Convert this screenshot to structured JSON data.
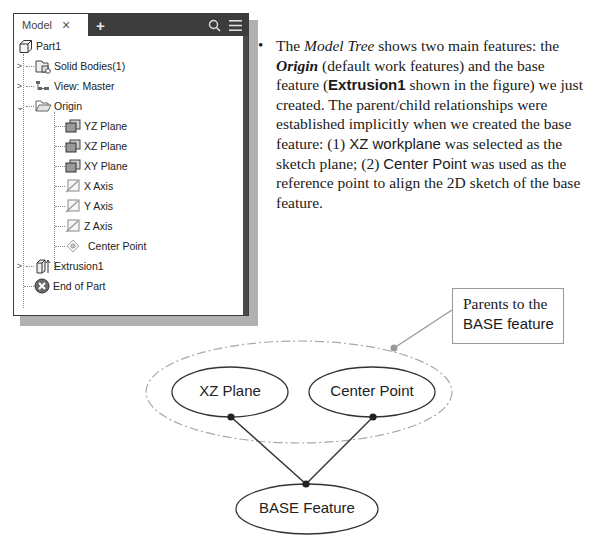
{
  "panel": {
    "tab_label": "Model",
    "close_glyph": "×",
    "add_glyph": "+",
    "icons": [
      "close-icon",
      "add-tab-icon",
      "search-icon",
      "menu-icon"
    ],
    "tree": [
      {
        "label": "Part1",
        "icon": "part-cube-icon",
        "level": 0,
        "expander": ""
      },
      {
        "label": "Solid Bodies(1)",
        "icon": "solid-bodies-icon",
        "level": 1,
        "expander": ">"
      },
      {
        "label": "View: Master",
        "icon": "view-icon",
        "level": 1,
        "expander": ">"
      },
      {
        "label": "Origin",
        "icon": "folder-open-icon",
        "level": 1,
        "expander": "v"
      },
      {
        "label": "YZ Plane",
        "icon": "work-plane-icon",
        "level": 2
      },
      {
        "label": "XZ Plane",
        "icon": "work-plane-icon",
        "level": 2
      },
      {
        "label": "XY Plane",
        "icon": "work-plane-icon",
        "level": 2
      },
      {
        "label": "X Axis",
        "icon": "work-axis-icon",
        "level": 2
      },
      {
        "label": "Y Axis",
        "icon": "work-axis-icon",
        "level": 2
      },
      {
        "label": "Z Axis",
        "icon": "work-axis-icon",
        "level": 2
      },
      {
        "label": "Center Point",
        "icon": "work-point-icon",
        "level": 2
      },
      {
        "label": "Extrusion1",
        "icon": "extrusion-icon",
        "level": 1,
        "expander": ">"
      },
      {
        "label": "End of Part",
        "icon": "end-of-part-icon",
        "level": 1
      }
    ]
  },
  "text": {
    "bullet": "•",
    "p1": "The ",
    "model_tree": "Model Tree",
    "p2": " shows two main features: the ",
    "origin": "Origin",
    "p3": " (default work features) and the base feature (",
    "extrusion1": "Extrusion1",
    "p4": " shown in the figure) we just created. The parent/child relationships were established implicitly when we created the base feature: (1) ",
    "xz_workplane": "XZ workplane",
    "p5": " was selected as the sketch plane; (2) ",
    "center_point": "Center Point",
    "p6": " was used as the reference point to align the 2D sketch of the base feature."
  },
  "diagram": {
    "callout_line1": "Parents to the",
    "callout_line2": "BASE feature",
    "parent1": "XZ Plane",
    "parent2": "Center Point",
    "child": "BASE Feature"
  }
}
